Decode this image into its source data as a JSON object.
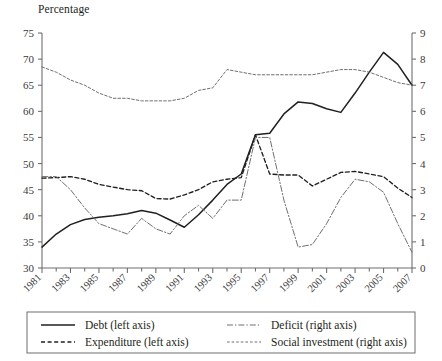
{
  "figure": {
    "axis_title": "Percentage",
    "background": "#ffffff",
    "line_color": "#231f20",
    "muted_color": "#6f6f6f"
  },
  "legend": {
    "position": "below-axes",
    "entries": [
      {
        "label": "Debt (left axis)",
        "style": "solid",
        "series": "debt"
      },
      {
        "label": "Deficit (right axis)",
        "style": "dash-dot",
        "series": "deficit"
      },
      {
        "label": "Expenditure (left axis)",
        "style": "dashed",
        "series": "expenditure"
      },
      {
        "label": "Social investment (right axis)",
        "style": "fine-dashed",
        "series": "social_investment"
      }
    ]
  },
  "chart_data": {
    "type": "line",
    "title": "",
    "subtitle": "",
    "xlabel": "",
    "ylabel": "Percentage",
    "y2label": "",
    "grid": false,
    "xlim": [
      1981,
      2007
    ],
    "ylim": [
      30,
      75
    ],
    "y2lim": [
      0,
      9
    ],
    "x": [
      1981,
      1982,
      1983,
      1984,
      1985,
      1986,
      1987,
      1988,
      1989,
      1990,
      1991,
      1992,
      1993,
      1994,
      1995,
      1996,
      1997,
      1998,
      1999,
      2000,
      2001,
      2002,
      2003,
      2004,
      2005,
      2006,
      2007
    ],
    "xticks": [
      1981,
      1983,
      1985,
      1987,
      1989,
      1991,
      1993,
      1995,
      1997,
      1999,
      2001,
      2003,
      2005,
      2007
    ],
    "xtick_labels": [
      "1981",
      "1983",
      "1985",
      "1987",
      "1989",
      "1991",
      "1993",
      "1995",
      "1997",
      "1999",
      "2001",
      "2003",
      "2005",
      "2007"
    ],
    "yticks": [
      30,
      35,
      40,
      45,
      50,
      55,
      60,
      65,
      70,
      75
    ],
    "ytick_labels": [
      "30",
      "35",
      "40",
      "45",
      "50",
      "55",
      "60",
      "65",
      "70",
      "75"
    ],
    "y2ticks": [
      0,
      1,
      2,
      3,
      4,
      5,
      6,
      7,
      8,
      9
    ],
    "y2tick_labels": [
      "0",
      "1",
      "2",
      "3",
      "4",
      "5",
      "6",
      "7",
      "8",
      "9"
    ],
    "series": [
      {
        "name": "Debt (left axis)",
        "axis": "left",
        "style": "solid",
        "values": [
          34.0,
          36.5,
          38.3,
          39.3,
          39.7,
          40.0,
          40.4,
          41.0,
          40.5,
          39.2,
          37.8,
          40.2,
          43.0,
          46.0,
          48.0,
          55.5,
          55.8,
          59.5,
          61.8,
          61.5,
          60.5,
          59.8,
          63.5,
          67.5,
          71.3,
          69.0,
          65.0
        ]
      },
      {
        "name": "Expenditure (left axis)",
        "axis": "left",
        "style": "dashed",
        "values": [
          47.2,
          47.3,
          47.5,
          47.0,
          46.0,
          45.5,
          45.0,
          44.8,
          43.3,
          43.2,
          44.0,
          45.0,
          46.5,
          47.0,
          47.3,
          55.5,
          48.0,
          47.8,
          47.8,
          45.7,
          47.0,
          48.3,
          48.5,
          48.0,
          47.5,
          45.3,
          43.5
        ]
      },
      {
        "name": "Deficit (right axis)",
        "axis": "right",
        "style": "dash-dot",
        "values": [
          3.5,
          3.5,
          3.0,
          2.3,
          1.7,
          1.5,
          1.3,
          1.9,
          1.5,
          1.3,
          2.0,
          2.4,
          1.9,
          2.6,
          2.6,
          5.0,
          5.0,
          2.6,
          0.8,
          0.9,
          1.7,
          2.7,
          3.4,
          3.3,
          2.9,
          1.7,
          0.6
        ]
      },
      {
        "name": "Social investment (right axis)",
        "axis": "right",
        "style": "fine-dashed",
        "values": [
          7.7,
          7.5,
          7.2,
          7.0,
          6.7,
          6.5,
          6.5,
          6.4,
          6.4,
          6.4,
          6.5,
          6.8,
          6.9,
          7.6,
          7.5,
          7.4,
          7.4,
          7.4,
          7.4,
          7.4,
          7.5,
          7.6,
          7.6,
          7.5,
          7.3,
          7.1,
          7.0
        ]
      }
    ]
  }
}
